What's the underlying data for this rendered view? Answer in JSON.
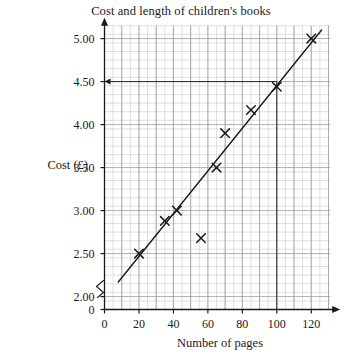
{
  "chart_data": {
    "type": "scatter",
    "title": "Cost and length of children's books",
    "xlabel": "Number of pages",
    "ylabel": "Cost (£)",
    "xlim": [
      0,
      130
    ],
    "ylim": [
      1.85,
      5.15
    ],
    "y_axis_break": true,
    "y_axis_break_symbol": "zigzag",
    "grid": true,
    "grid_minor_x": 5,
    "grid_minor_y": 0.1,
    "grid_major_x": 10,
    "grid_major_y": 0.5,
    "legend": "none",
    "x_ticks": [
      0,
      20,
      40,
      60,
      80,
      100,
      120
    ],
    "x_tick_labels": [
      "0",
      "20",
      "40",
      "60",
      "80",
      "100",
      "120"
    ],
    "y_ticks": [
      2.0,
      2.5,
      3.0,
      3.5,
      4.0,
      4.5,
      5.0
    ],
    "y_tick_labels": [
      "2.00",
      "2.50",
      "3.00",
      "3.50",
      "4.00",
      "4.50",
      "5.00"
    ],
    "y_origin_label": "0",
    "points": [
      {
        "x": 20,
        "y": 2.5
      },
      {
        "x": 35,
        "y": 2.88
      },
      {
        "x": 42,
        "y": 3.0
      },
      {
        "x": 56,
        "y": 2.68
      },
      {
        "x": 65,
        "y": 3.5
      },
      {
        "x": 70,
        "y": 3.9
      },
      {
        "x": 85,
        "y": 4.17
      },
      {
        "x": 100,
        "y": 4.44
      },
      {
        "x": 120,
        "y": 5.0
      }
    ],
    "marker": "x",
    "trend_line": {
      "label": "line of best fit",
      "x_start": 8,
      "y_start": 2.17,
      "x_end": 126,
      "y_end": 5.1
    },
    "construction_lines": [
      {
        "type": "horizontal",
        "y": 4.5,
        "x_from": 0,
        "x_to": 100,
        "arrow": "left"
      },
      {
        "type": "vertical",
        "x": 100,
        "y_from": 4.5,
        "y_to": 1.85,
        "arrow": "none"
      }
    ],
    "annotations": [],
    "colors": {
      "ink": "#1a1a1a",
      "grid_minor": "#d2d2d2",
      "grid_major": "#9a9a9a",
      "background": "#ffffff"
    }
  }
}
